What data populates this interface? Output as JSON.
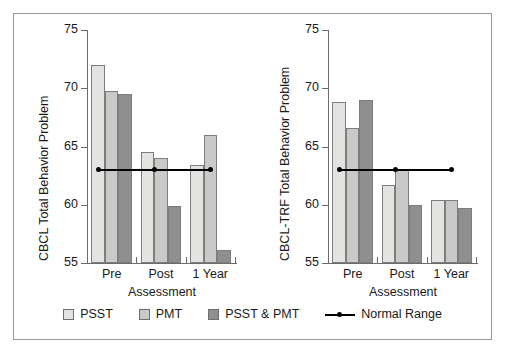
{
  "figure": {
    "background_color": "#ffffff",
    "frame_color": "#9a9a9a"
  },
  "legend": {
    "items": [
      {
        "label": "PSST",
        "color": "#e3e3e1",
        "marker": "square-swatch"
      },
      {
        "label": "PMT",
        "color": "#c9c9c7",
        "marker": "square-swatch"
      },
      {
        "label": "PSST & PMT",
        "color": "#8f8f8f",
        "marker": "square-swatch"
      },
      {
        "label": "Normal Range",
        "color": "#000000",
        "marker": "line-with-dot"
      }
    ]
  },
  "chart_data": [
    {
      "type": "bar",
      "title": "",
      "panel": "left",
      "xlabel": "Assessment",
      "ylabel": "CBCL Total Behavior Problem",
      "categories": [
        "Pre",
        "Post",
        "1 Year"
      ],
      "ylim": [
        55,
        75
      ],
      "yticks": [
        55,
        60,
        65,
        70,
        75
      ],
      "ytick_labels": [
        "55",
        "60",
        "65",
        "70",
        "75"
      ],
      "grid": false,
      "legend_position": "bottom",
      "series": [
        {
          "name": "PSST",
          "color": "#e3e3e1",
          "values": [
            72.0,
            64.5,
            63.4
          ]
        },
        {
          "name": "PMT",
          "color": "#c9c9c7",
          "values": [
            69.8,
            64.0,
            66.0
          ]
        },
        {
          "name": "PSST & PMT",
          "color": "#8f8f8f",
          "values": [
            69.5,
            59.9,
            56.1
          ]
        }
      ],
      "reference_line": {
        "name": "Normal Range",
        "value": 63,
        "color": "#000000",
        "markers_at": [
          "Pre",
          "Post",
          "1 Year"
        ]
      }
    },
    {
      "type": "bar",
      "title": "",
      "panel": "right",
      "xlabel": "Assessment",
      "ylabel": "CBCL-TRF Total Behavior Problem",
      "categories": [
        "Pre",
        "Post",
        "1 Year"
      ],
      "ylim": [
        55,
        75
      ],
      "yticks": [
        55,
        60,
        65,
        70,
        75
      ],
      "ytick_labels": [
        "55",
        "60",
        "65",
        "70",
        "75"
      ],
      "grid": false,
      "legend_position": "bottom",
      "series": [
        {
          "name": "PSST",
          "color": "#e3e3e1",
          "values": [
            68.8,
            61.7,
            60.4
          ]
        },
        {
          "name": "PMT",
          "color": "#c9c9c7",
          "values": [
            66.6,
            63.0,
            60.4
          ]
        },
        {
          "name": "PSST & PMT",
          "color": "#8f8f8f",
          "values": [
            69.0,
            60.0,
            59.7
          ]
        }
      ],
      "reference_line": {
        "name": "Normal Range",
        "value": 63,
        "color": "#000000",
        "markers_at": [
          "Pre",
          "Post",
          "1 Year"
        ]
      }
    }
  ]
}
